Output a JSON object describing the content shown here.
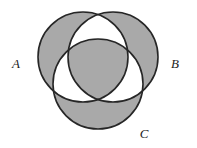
{
  "figure": {
    "kind": "venn-diagram",
    "set_count": 3,
    "caption": "",
    "background_color": "#ffffff",
    "shaded_color": "#a9a9a9",
    "unshaded_color": "#ffffff",
    "outline_color": "#262626",
    "outline_width": 1.6,
    "label_color": "#1c1c1c"
  },
  "sets": [
    {
      "id": "A",
      "label": "A",
      "label_x": 16,
      "label_y": 68,
      "center_x": 83,
      "center_y": 57,
      "radius": 45
    },
    {
      "id": "B",
      "label": "B",
      "label_x": 175,
      "label_y": 68,
      "center_x": 113,
      "center_y": 57,
      "radius": 45
    },
    {
      "id": "C",
      "label": "C",
      "label_x": 144,
      "label_y": 138,
      "center_x": 98,
      "center_y": 84,
      "radius": 45
    }
  ],
  "regions": [
    {
      "id": "A-only",
      "expression": "A \\ (B ∪ C)",
      "shaded": true
    },
    {
      "id": "B-only",
      "expression": "B \\ (A ∪ C)",
      "shaded": true
    },
    {
      "id": "C-only",
      "expression": "C \\ (A ∪ B)",
      "shaded": true
    },
    {
      "id": "AB-only",
      "expression": "(A ∩ B) \\ C",
      "shaded": false
    },
    {
      "id": "AC-only",
      "expression": "(A ∩ C) \\ B",
      "shaded": false
    },
    {
      "id": "BC-only",
      "expression": "(B ∩ C) \\ A",
      "shaded": false
    },
    {
      "id": "ABC",
      "expression": "A ∩ B ∩ C",
      "shaded": true
    }
  ]
}
